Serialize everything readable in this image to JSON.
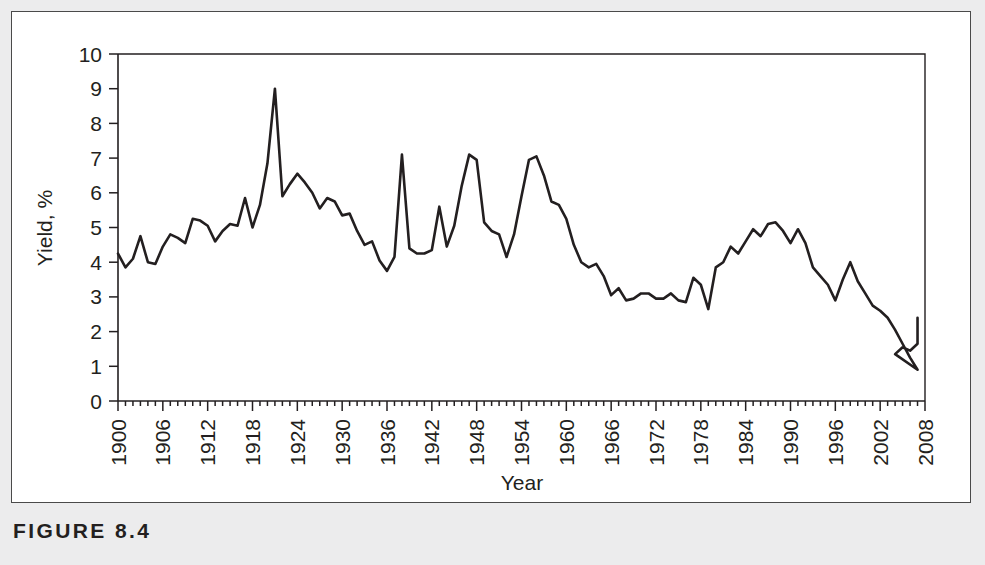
{
  "figure": {
    "caption": "FIGURE 8.4"
  },
  "chart_data": {
    "type": "line",
    "title": "",
    "xlabel": "Year",
    "ylabel": "Yield, %",
    "xlim": [
      1900,
      2008
    ],
    "ylim": [
      0,
      10
    ],
    "grid": false,
    "legend": null,
    "y_ticks": [
      0,
      1,
      2,
      3,
      4,
      5,
      6,
      7,
      8,
      9,
      10
    ],
    "y_tick_labels": [
      "0",
      "1",
      "2",
      "3",
      "4",
      "5",
      "6",
      "7",
      "8",
      "9",
      "10"
    ],
    "x_ticks": [
      1900,
      1906,
      1912,
      1918,
      1924,
      1930,
      1936,
      1942,
      1948,
      1954,
      1960,
      1966,
      1972,
      1978,
      1984,
      1990,
      1996,
      2002,
      2008
    ],
    "x_tick_labels": [
      "1900",
      "1906",
      "1912",
      "1918",
      "1924",
      "1930",
      "1936",
      "1942",
      "1948",
      "1954",
      "1960",
      "1966",
      "1972",
      "1978",
      "1984",
      "1990",
      "1996",
      "2002",
      "2008"
    ],
    "x_minor_tick_interval": 1,
    "line_color": "#231f20",
    "series": [
      {
        "name": "Yield",
        "x": [
          1900,
          1901,
          1902,
          1903,
          1904,
          1905,
          1906,
          1907,
          1908,
          1909,
          1910,
          1911,
          1912,
          1913,
          1914,
          1915,
          1916,
          1917,
          1918,
          1919,
          1920,
          1921,
          1922,
          1923,
          1924,
          1925,
          1926,
          1927,
          1928,
          1929,
          1930,
          1931,
          1932,
          1933,
          1934,
          1935,
          1936,
          1937,
          1938,
          1939,
          1940,
          1941,
          1942,
          1943,
          1944,
          1945,
          1946,
          1947,
          1948,
          1949,
          1950,
          1951,
          1952,
          1953,
          1954,
          1955,
          1956,
          1957,
          1958,
          1959,
          1960,
          1961,
          1962,
          1963,
          1964,
          1965,
          1966,
          1967,
          1968,
          1969,
          1970,
          1971,
          1972,
          1973,
          1974,
          1975,
          1976,
          1977,
          1978,
          1979,
          1980,
          1981,
          1982,
          1983,
          1984,
          1985,
          1986,
          1987,
          1988,
          1989,
          1990,
          1991,
          1992,
          1993,
          1994,
          1995,
          1996,
          1997,
          1998,
          1999,
          2000,
          2001,
          2002,
          2003,
          2004,
          2005,
          2006,
          2007
        ],
        "values": [
          4.25,
          3.85,
          4.1,
          4.75,
          4.0,
          3.95,
          4.45,
          4.8,
          4.7,
          4.55,
          5.25,
          5.2,
          5.05,
          4.6,
          4.9,
          5.1,
          5.05,
          5.85,
          5.0,
          5.65,
          6.85,
          9.0,
          5.9,
          6.25,
          6.55,
          6.3,
          6.0,
          5.55,
          5.85,
          5.75,
          5.35,
          5.4,
          4.9,
          4.5,
          4.6,
          4.05,
          3.75,
          4.15,
          7.1,
          4.4,
          4.25,
          4.25,
          4.35,
          5.6,
          4.45,
          5.05,
          6.2,
          7.1,
          6.95,
          5.15,
          4.9,
          4.8,
          4.15,
          4.8,
          5.9,
          6.95,
          7.05,
          6.5,
          5.75,
          5.65,
          5.25,
          4.5,
          4.0,
          3.85,
          3.95,
          3.6,
          3.05,
          3.25,
          2.9,
          2.95,
          3.1,
          3.1,
          2.95,
          2.95,
          3.1,
          2.9,
          2.85,
          3.55,
          3.35,
          2.65,
          3.85,
          4.0,
          4.45,
          4.25,
          4.6,
          4.95,
          4.75,
          5.1,
          5.15,
          4.9,
          4.55,
          4.95,
          4.55,
          3.85,
          3.6,
          3.35,
          2.9,
          3.5,
          4.0,
          3.45,
          3.1,
          2.75,
          2.6,
          2.4,
          2.05,
          1.65,
          1.25,
          0.9
        ]
      },
      {
        "name": "Yield tail",
        "x": [
          2003,
          2004,
          2005,
          2006,
          2007
        ],
        "values": [
          0.9,
          1.35,
          1.55,
          1.45,
          1.65
        ]
      }
    ],
    "notes": {
      "max_value": 9.0,
      "max_year": 1921,
      "min_value": 0.9,
      "min_year": 2003,
      "final_value": 2.4,
      "final_year": 2007
    }
  }
}
